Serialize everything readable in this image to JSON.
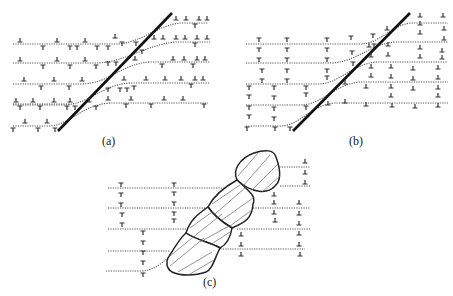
{
  "figure": {
    "panels": [
      {
        "id": "a",
        "label": "(a)",
        "description": "Dislocations (mixed T and ⊥) distributed along dotted lattice planes, cut by a straight slip band / fault line"
      },
      {
        "id": "b",
        "label": "(b)",
        "description": "Dislocations sorted: T-type on left of fault, ⊥-type on right, stacked in columns (polygonized walls)"
      },
      {
        "id": "c",
        "label": "(c)",
        "description": "Recrystallized grains (hatched, outlined) along the former band, with dislocation walls on either side"
      }
    ],
    "symbols": {
      "positive_edge_dislocation": "⊥",
      "negative_edge_dislocation": "T"
    },
    "colors": {
      "line": "#111111",
      "layer": "#555555",
      "background": "#ffffff"
    }
  }
}
